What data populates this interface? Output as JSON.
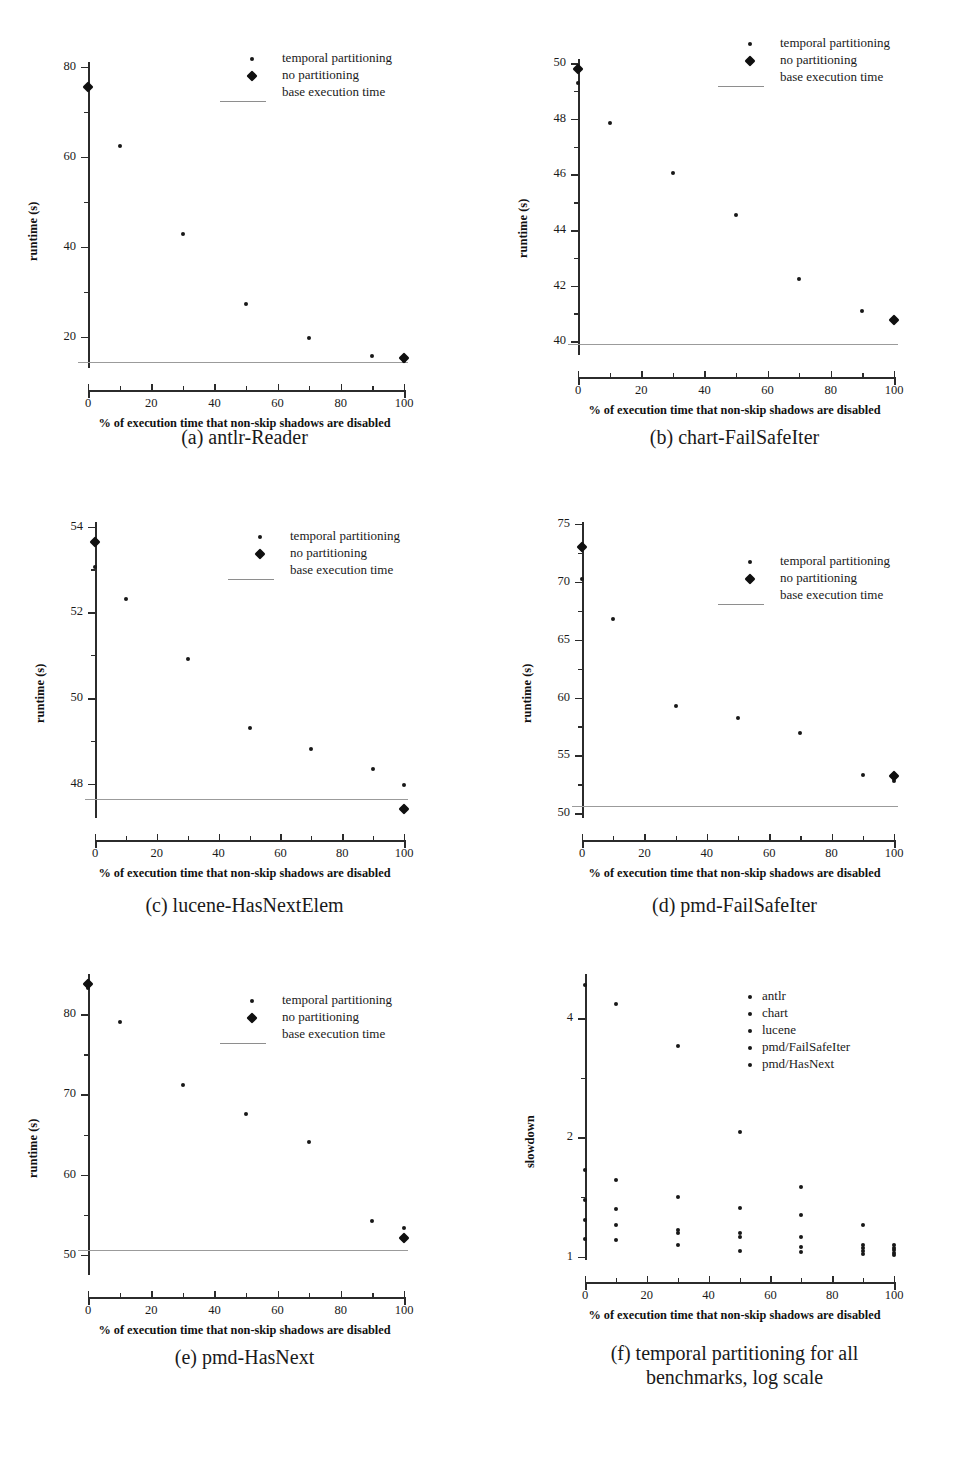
{
  "figure": {
    "xlabel": "% of execution time that non-skip shadows are disabled",
    "legend_runtime": [
      "temporal partitioning",
      "no partitioning",
      "base execution time"
    ]
  },
  "chart_data": [
    {
      "id": "a",
      "type": "scatter",
      "title": "(a) antlr-Reader",
      "caption_lines": [
        "(a) antlr-Reader"
      ],
      "xlabel": "% of execution time that non-skip shadows are disabled",
      "ylabel": "runtime (s)",
      "xlim": [
        0,
        100
      ],
      "ylim": [
        13,
        82
      ],
      "xticks": [
        0,
        20,
        40,
        60,
        80,
        100
      ],
      "yticks": [
        20,
        40,
        60,
        80
      ],
      "grid": false,
      "legend_position": "upper-right",
      "legend": [
        "temporal partitioning",
        "no partitioning",
        "base execution time"
      ],
      "base_execution_time": 14.3,
      "series": [
        {
          "name": "temporal partitioning",
          "marker": "dot",
          "x": [
            0,
            10,
            30,
            50,
            70,
            90,
            100
          ],
          "values": [
            75.5,
            62.5,
            42.8,
            27.2,
            19.6,
            15.7,
            14.6
          ]
        },
        {
          "name": "no partitioning",
          "marker": "diamond",
          "x": [
            0,
            100
          ],
          "values": [
            75.6,
            15.2
          ]
        }
      ]
    },
    {
      "id": "b",
      "type": "scatter",
      "title": "(b) chart-FailSafeIter",
      "caption_lines": [
        "(b) chart-FailSafeIter"
      ],
      "xlabel": "% of execution time that non-skip shadows are disabled",
      "ylabel": "runtime (s)",
      "xlim": [
        0,
        100
      ],
      "ylim": [
        39.5,
        50.3
      ],
      "xticks": [
        0,
        20,
        40,
        60,
        80,
        100
      ],
      "yticks": [
        40,
        42,
        44,
        46,
        48,
        50
      ],
      "grid": false,
      "legend_position": "upper-right",
      "legend": [
        "temporal partitioning",
        "no partitioning",
        "base execution time"
      ],
      "base_execution_time": 39.9,
      "series": [
        {
          "name": "temporal partitioning",
          "marker": "dot",
          "x": [
            0,
            10,
            30,
            50,
            70,
            90
          ],
          "values": [
            49.3,
            47.85,
            46.05,
            44.55,
            42.25,
            41.1
          ]
        },
        {
          "name": "no partitioning",
          "marker": "diamond",
          "x": [
            0,
            100
          ],
          "values": [
            49.8,
            40.75
          ]
        }
      ]
    },
    {
      "id": "c",
      "type": "scatter",
      "title": "(c) lucene-HasNextElem",
      "caption_lines": [
        "(c) lucene-HasNextElem"
      ],
      "xlabel": "% of execution time that non-skip shadows are disabled",
      "ylabel": "runtime (s)",
      "xlim": [
        0,
        100
      ],
      "ylim": [
        47.2,
        54.2
      ],
      "xticks": [
        0,
        20,
        40,
        60,
        80,
        100
      ],
      "yticks": [
        48,
        50,
        52,
        54
      ],
      "grid": false,
      "legend_position": "upper-right",
      "legend": [
        "temporal partitioning",
        "no partitioning",
        "base execution time"
      ],
      "base_execution_time": 47.65,
      "series": [
        {
          "name": "temporal partitioning",
          "marker": "dot",
          "x": [
            0,
            10,
            30,
            50,
            70,
            90,
            100
          ],
          "values": [
            53.05,
            52.3,
            50.9,
            49.3,
            48.8,
            48.35,
            47.98
          ]
        },
        {
          "name": "no partitioning",
          "marker": "diamond",
          "x": [
            0,
            100
          ],
          "values": [
            53.65,
            47.4
          ]
        }
      ]
    },
    {
      "id": "d",
      "type": "scatter",
      "title": "(d) pmd-FailSafeIter",
      "caption_lines": [
        "(d) pmd-FailSafeIter"
      ],
      "xlabel": "% of execution time that non-skip shadows are disabled",
      "ylabel": "runtime (s)",
      "xlim": [
        0,
        100
      ],
      "ylim": [
        49.6,
        75.5
      ],
      "xticks": [
        0,
        20,
        40,
        60,
        80,
        100
      ],
      "yticks": [
        50,
        55,
        60,
        65,
        70,
        75
      ],
      "grid": false,
      "legend_position": "upper-right",
      "legend": [
        "temporal partitioning",
        "no partitioning",
        "base execution time"
      ],
      "base_execution_time": 50.6,
      "series": [
        {
          "name": "temporal partitioning",
          "marker": "dot",
          "x": [
            0,
            10,
            30,
            50,
            70,
            90,
            100
          ],
          "values": [
            70.2,
            66.8,
            59.3,
            58.2,
            56.9,
            53.3,
            52.8
          ]
        },
        {
          "name": "no partitioning",
          "marker": "diamond",
          "x": [
            0,
            100
          ],
          "values": [
            73.0,
            53.2
          ]
        }
      ]
    },
    {
      "id": "e",
      "type": "scatter",
      "title": "(e) pmd-HasNext",
      "caption_lines": [
        "(e) pmd-HasNext"
      ],
      "xlabel": "% of execution time that non-skip shadows are disabled",
      "ylabel": "runtime (s)",
      "xlim": [
        0,
        100
      ],
      "ylim": [
        47.5,
        85.5
      ],
      "xticks": [
        0,
        20,
        40,
        60,
        80,
        100
      ],
      "yticks": [
        50,
        60,
        70,
        80
      ],
      "grid": false,
      "legend_position": "upper-right",
      "legend": [
        "temporal partitioning",
        "no partitioning",
        "base execution time"
      ],
      "base_execution_time": 50.6,
      "series": [
        {
          "name": "temporal partitioning",
          "marker": "dot",
          "x": [
            0,
            10,
            30,
            50,
            70,
            90,
            100
          ],
          "values": [
            83.2,
            79.0,
            71.2,
            67.5,
            64.1,
            54.2,
            53.3
          ]
        },
        {
          "name": "no partitioning",
          "marker": "diamond",
          "x": [
            0,
            100
          ],
          "values": [
            83.8,
            52.1
          ]
        }
      ]
    },
    {
      "id": "f",
      "type": "scatter",
      "title": "(f) temporal partitioning for all benchmarks, log scale",
      "caption_lines": [
        "(f) temporal partitioning for all",
        "benchmarks, log scale"
      ],
      "xlabel": "% of execution time that non-skip shadows are disabled",
      "ylabel": "slowdown",
      "xlim": [
        0,
        100
      ],
      "ylim": [
        0.98,
        5.3
      ],
      "yscale": "log",
      "xticks": [
        0,
        20,
        40,
        60,
        80,
        100
      ],
      "yticks": [
        1,
        2,
        4
      ],
      "grid": false,
      "legend_position": "upper-right",
      "legend": [
        "antlr",
        "chart",
        "lucene",
        "pmd/FailSafeIter",
        "pmd/HasNext"
      ],
      "series": [
        {
          "name": "antlr",
          "marker": "dot",
          "x": [
            0,
            10,
            30,
            50,
            70,
            90,
            100
          ],
          "values": [
            4.85,
            4.35,
            3.4,
            2.07,
            1.5,
            1.2,
            1.07
          ]
        },
        {
          "name": "chart",
          "marker": "dot",
          "x": [
            0,
            10,
            30,
            50,
            70,
            90,
            100
          ],
          "values": [
            1.24,
            1.2,
            1.15,
            1.12,
            1.06,
            1.03,
            1.02
          ]
        },
        {
          "name": "lucene",
          "marker": "dot",
          "x": [
            0,
            10,
            30,
            50,
            70,
            90,
            100
          ],
          "values": [
            1.11,
            1.1,
            1.07,
            1.035,
            1.025,
            1.015,
            1.01
          ]
        },
        {
          "name": "pmd/FailSafeIter",
          "marker": "dot",
          "x": [
            0,
            10,
            30,
            50,
            70,
            90,
            100
          ],
          "values": [
            1.39,
            1.32,
            1.17,
            1.15,
            1.12,
            1.05,
            1.04
          ]
        },
        {
          "name": "pmd/HasNext",
          "marker": "dot",
          "x": [
            0,
            10,
            30,
            50,
            70,
            90,
            100
          ],
          "values": [
            1.65,
            1.56,
            1.41,
            1.33,
            1.27,
            1.07,
            1.05
          ]
        }
      ]
    }
  ]
}
